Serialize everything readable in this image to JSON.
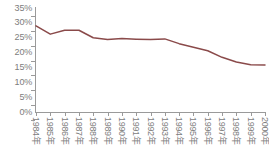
{
  "chart_data": {
    "type": "line",
    "title": "",
    "subtitle": "",
    "xlabel": "",
    "ylabel": "",
    "categories": [
      "1984年",
      "1985年",
      "1986年",
      "1987年",
      "1988年",
      "1989年",
      "1990年",
      "1991年",
      "1992年",
      "1993年",
      "1994年",
      "1995年",
      "1996年",
      "1997年",
      "1998年",
      "1999年",
      "2000年"
    ],
    "values": [
      29.0,
      26.2,
      27.5,
      27.5,
      25.0,
      24.4,
      24.7,
      24.5,
      24.4,
      24.6,
      23.0,
      21.8,
      20.6,
      18.4,
      16.8,
      15.9,
      15.8
    ],
    "series": [
      {
        "name": "",
        "color": "#8a4a4a",
        "values": [
          29.0,
          26.2,
          27.5,
          27.5,
          25.0,
          24.4,
          24.7,
          24.5,
          24.4,
          24.6,
          23.0,
          21.8,
          20.6,
          18.4,
          16.8,
          15.9,
          15.8
        ]
      }
    ],
    "ylim": [
      0,
      35
    ],
    "y_ticks": [
      0,
      5,
      10,
      15,
      20,
      25,
      30,
      35
    ],
    "y_tick_labels": [
      "0%",
      "5%",
      "10%",
      "15%",
      "20%",
      "25%",
      "30%",
      "35%"
    ],
    "grid": false,
    "legend": false,
    "legend_position": "none",
    "axis_color": "#9a9a9a",
    "tick_label_color": "#7d7d7d",
    "background_color": "#ffffff",
    "line_color": "#8a4a4a",
    "line_width": 1.5,
    "markers": false,
    "x_label_rotation": 90
  }
}
